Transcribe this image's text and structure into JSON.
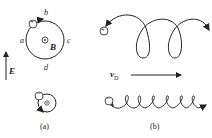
{
  "panel_a": {
    "caption": "(a)",
    "labels": {
      "a": "a",
      "b": "b",
      "c": "c",
      "d": "d"
    },
    "field_B": "B",
    "field_E": "E",
    "big_particle_sign": "+",
    "small_particle_sign": "−"
  },
  "panel_b": {
    "caption": "(b)",
    "drift_label": "v",
    "drift_sub": "D",
    "big_particle_sign": "+",
    "small_particle_sign": "−"
  },
  "colors": {
    "ink": "#222222",
    "background": "#ffffff"
  }
}
